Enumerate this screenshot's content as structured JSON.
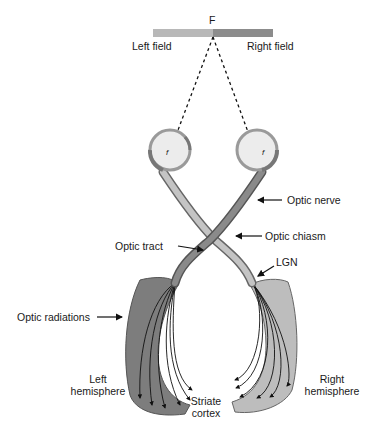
{
  "visual_field": {
    "fixation_label": "F",
    "left_label": "Left field",
    "right_label": "Right field",
    "left_color": "#b8b8b8",
    "right_color": "#8c8c8c"
  },
  "labels": {
    "optic_nerve": "Optic nerve",
    "optic_chiasm": "Optic chiasm",
    "optic_tract": "Optic tract",
    "lgn": "LGN",
    "optic_radiations": "Optic radiations",
    "left_hemisphere_line1": "Left",
    "left_hemisphere_line2": "hemisphere",
    "right_hemisphere_line1": "Right",
    "right_hemisphere_line2": "hemisphere",
    "striate_line1": "Striate",
    "striate_line2": "cortex"
  },
  "eyes": {
    "left_fovea_label": "f",
    "right_fovea_label": "f"
  },
  "colors": {
    "left_pathway": "#7a7a7a",
    "right_pathway": "#bdbdbd",
    "outline": "#555555"
  }
}
